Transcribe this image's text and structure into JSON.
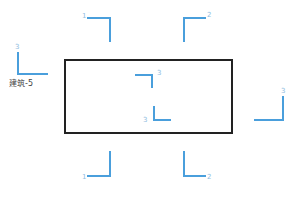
{
  "diagram": {
    "title_label": "建筑-5",
    "colors": {
      "outline": "#222222",
      "marker": "#4a9fdc",
      "marker_text": "#8fbde0",
      "label_text": "#444444"
    },
    "main_rect": {
      "x": 64,
      "y": 59,
      "w": 169,
      "h": 75
    },
    "markers": [
      {
        "id": "top-1",
        "label": "1",
        "corner": "top-right",
        "x": 87,
        "y": 17,
        "w": 24,
        "h": 25,
        "lx": 82,
        "ly": 13
      },
      {
        "id": "top-2",
        "label": "2",
        "corner": "top-left",
        "x": 183,
        "y": 17,
        "w": 23,
        "h": 25,
        "lx": 207,
        "ly": 12
      },
      {
        "id": "left-3",
        "label": "3",
        "corner": "bottom-left",
        "x": 17,
        "y": 52,
        "w": 31,
        "h": 23,
        "lx": 15,
        "ly": 44
      },
      {
        "id": "inner-top-3",
        "label": "3",
        "corner": "top-right",
        "x": 135,
        "y": 74,
        "w": 18,
        "h": 14,
        "lx": 157,
        "ly": 70
      },
      {
        "id": "inner-bot-3",
        "label": "3",
        "corner": "bottom-left",
        "x": 153,
        "y": 106,
        "w": 18,
        "h": 15,
        "lx": 143,
        "ly": 117
      },
      {
        "id": "right-3",
        "label": "3",
        "corner": "bottom-right",
        "x": 254,
        "y": 96,
        "w": 30,
        "h": 25,
        "lx": 281,
        "ly": 88
      },
      {
        "id": "bottom-1",
        "label": "1",
        "corner": "bottom-right",
        "x": 87,
        "y": 151,
        "w": 24,
        "h": 26,
        "lx": 82,
        "ly": 174
      },
      {
        "id": "bottom-2",
        "label": "2",
        "corner": "bottom-left",
        "x": 183,
        "y": 151,
        "w": 23,
        "h": 26,
        "lx": 207,
        "ly": 174
      }
    ],
    "label_pos": {
      "x": 9,
      "y": 79
    }
  }
}
